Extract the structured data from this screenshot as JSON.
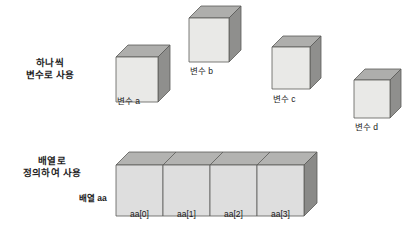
{
  "figure": {
    "background_color": "#ffffff",
    "palette": {
      "face_front": "#e9e9e7",
      "face_top": "#aeaeac",
      "face_side": "#8f8f8d",
      "outline": "#5a5a58",
      "array_front": "#dedede",
      "array_top": "#b3b3b1",
      "array_side": "#8a8a88",
      "text": "#1a1a1a"
    }
  },
  "sections": [
    {
      "id": "individual-variables",
      "label_line1": "하나씩",
      "label_line2": "변수로 사용",
      "label_x": 50,
      "label_y": 57
    },
    {
      "id": "array-definition",
      "label_line1": "배열로",
      "label_line2": "정의하여 사용",
      "label_x": 52,
      "label_y": 155
    }
  ],
  "cubes": [
    {
      "id": "cube-a",
      "label": "변수 a",
      "x": 116,
      "y": 45,
      "w": 42,
      "h": 45,
      "depth": 12,
      "label_x": 117,
      "label_y": 96
    },
    {
      "id": "cube-b",
      "label": "변수 b",
      "x": 189,
      "y": 6,
      "w": 40,
      "h": 44,
      "depth": 12,
      "label_x": 190,
      "label_y": 66
    },
    {
      "id": "cube-c",
      "label": "변수 c",
      "x": 272,
      "y": 36,
      "w": 38,
      "h": 42,
      "depth": 11,
      "label_x": 273,
      "label_y": 94
    },
    {
      "id": "cube-d",
      "label": "변수 d",
      "x": 354,
      "y": 69,
      "w": 36,
      "h": 38,
      "depth": 11,
      "label_x": 355,
      "label_y": 122
    }
  ],
  "array": {
    "name_label": "배열 aa",
    "name_label_x": 79,
    "name_label_y": 193,
    "x": 116,
    "y": 152,
    "cell_width": 47,
    "height": 51,
    "depth": 13,
    "cells": [
      {
        "label": "aa[0]",
        "index": 0
      },
      {
        "label": "aa[1]",
        "index": 1
      },
      {
        "label": "aa[2]",
        "index": 2
      },
      {
        "label": "aa[3]",
        "index": 3
      }
    ],
    "cell_label_y": 209
  }
}
